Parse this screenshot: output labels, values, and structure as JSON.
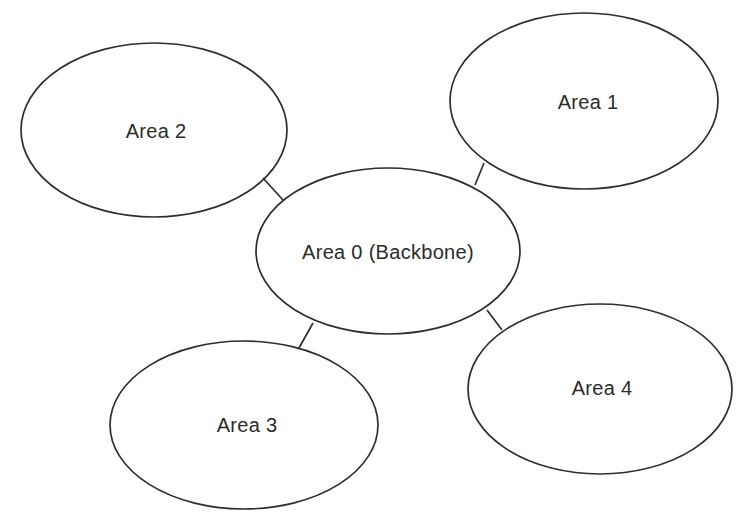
{
  "diagram": {
    "type": "network-topology",
    "nodes": [
      {
        "id": "area0",
        "label": "Area 0 (Backbone)"
      },
      {
        "id": "area1",
        "label": "Area 1"
      },
      {
        "id": "area2",
        "label": "Area 2"
      },
      {
        "id": "area3",
        "label": "Area 3"
      },
      {
        "id": "area4",
        "label": "Area 4"
      }
    ],
    "edges": [
      {
        "from": "area2",
        "to": "area0"
      },
      {
        "from": "area1",
        "to": "area0"
      },
      {
        "from": "area0",
        "to": "area3"
      },
      {
        "from": "area0",
        "to": "area4"
      }
    ],
    "colors": {
      "stroke": "#2e2e2e",
      "text": "#2b2b2b",
      "background": "#ffffff"
    }
  }
}
